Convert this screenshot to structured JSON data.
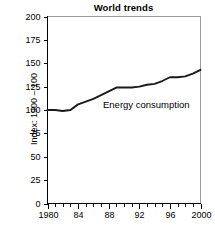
{
  "chart_data": {
    "type": "line",
    "title": "World trends",
    "xlabel": "",
    "ylabel": "Index: 1900 – 100",
    "xlim": [
      1980,
      2000
    ],
    "ylim": [
      0,
      200
    ],
    "grid": false,
    "legend_position": "inline-annotation",
    "y_ticks": [
      0,
      25,
      50,
      75,
      100,
      125,
      150,
      175,
      200
    ],
    "y_tick_labels": [
      "0",
      "25",
      "50",
      "75",
      "100",
      "125",
      "150",
      "175",
      "200"
    ],
    "x_ticks": [
      1980,
      1984,
      1988,
      1992,
      1996,
      2000
    ],
    "x_tick_labels": [
      "1980",
      "84",
      "88",
      "92",
      "96",
      "2000"
    ],
    "x_minor_tick_step": 1,
    "series": [
      {
        "name": "Energy consumption",
        "annotation": "Energy consumption",
        "color": "#1a1a1a",
        "x": [
          1980,
          1981,
          1982,
          1983,
          1984,
          1985,
          1986,
          1987,
          1988,
          1989,
          1990,
          1991,
          1992,
          1993,
          1994,
          1995,
          1996,
          1997,
          1998,
          1999,
          2000
        ],
        "values": [
          100,
          100,
          99,
          100,
          106,
          109,
          112,
          116,
          120,
          124,
          124,
          124,
          125,
          127,
          128,
          131,
          135,
          135,
          136,
          139,
          143
        ]
      }
    ]
  },
  "annotation": {
    "label": "Energy consumption"
  }
}
